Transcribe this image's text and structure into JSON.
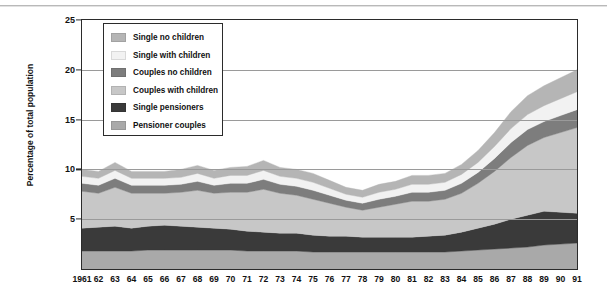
{
  "chart_data": {
    "type": "area",
    "stacked": true,
    "title": "",
    "xlabel": "",
    "ylabel": "Percentage of total population",
    "ylim": [
      0,
      25
    ],
    "yticks": [
      5,
      10,
      15,
      20,
      25
    ],
    "grid": true,
    "legend_position": "top-left inside",
    "x": [
      1961,
      1962,
      1963,
      1964,
      1965,
      1966,
      1967,
      1968,
      1969,
      1970,
      1971,
      1972,
      1973,
      1974,
      1975,
      1976,
      1977,
      1978,
      1979,
      1980,
      1981,
      1982,
      1983,
      1984,
      1985,
      1986,
      1987,
      1988,
      1989,
      1990,
      1991
    ],
    "xticklabels": [
      "1961",
      "62",
      "63",
      "64",
      "65",
      "66",
      "67",
      "68",
      "69",
      "70",
      "71",
      "72",
      "73",
      "74",
      "75",
      "76",
      "77",
      "78",
      "79",
      "80",
      "81",
      "82",
      "83",
      "84",
      "85",
      "86",
      "87",
      "88",
      "89",
      "90",
      "91"
    ],
    "series": [
      {
        "name": "Pensioner couples",
        "color": "#a9a9a9",
        "values": [
          1.8,
          1.8,
          1.8,
          1.8,
          1.9,
          1.9,
          1.9,
          1.9,
          1.9,
          1.9,
          1.8,
          1.8,
          1.8,
          1.8,
          1.7,
          1.7,
          1.7,
          1.7,
          1.7,
          1.7,
          1.7,
          1.7,
          1.7,
          1.8,
          1.9,
          2.0,
          2.1,
          2.2,
          2.4,
          2.5,
          2.6
        ]
      },
      {
        "name": "Single pensioners",
        "color": "#3a3a3a",
        "values": [
          2.3,
          2.4,
          2.5,
          2.3,
          2.4,
          2.5,
          2.4,
          2.3,
          2.2,
          2.1,
          2.0,
          1.9,
          1.8,
          1.8,
          1.7,
          1.6,
          1.6,
          1.5,
          1.5,
          1.5,
          1.5,
          1.6,
          1.7,
          1.9,
          2.2,
          2.5,
          2.9,
          3.2,
          3.4,
          3.2,
          3.0
        ]
      },
      {
        "name": "Couples with children",
        "color": "#c7c7c7",
        "values": [
          3.7,
          3.4,
          3.9,
          3.5,
          3.3,
          3.2,
          3.4,
          3.7,
          3.5,
          3.7,
          3.9,
          4.3,
          4.0,
          3.8,
          3.6,
          3.3,
          2.9,
          2.7,
          3.0,
          3.3,
          3.6,
          3.5,
          3.6,
          3.9,
          4.5,
          5.3,
          6.2,
          7.0,
          7.4,
          8.0,
          8.6
        ]
      },
      {
        "name": "Couples no children",
        "color": "#7d7d7d",
        "values": [
          0.8,
          0.8,
          0.9,
          0.8,
          0.8,
          0.8,
          0.8,
          0.9,
          0.8,
          0.9,
          0.9,
          1.0,
          0.9,
          0.9,
          0.9,
          0.8,
          0.7,
          0.7,
          0.8,
          0.8,
          0.9,
          0.9,
          0.9,
          1.0,
          1.1,
          1.3,
          1.5,
          1.6,
          1.6,
          1.7,
          1.8
        ]
      },
      {
        "name": "Single with children",
        "color": "#f2f2f2",
        "values": [
          0.7,
          0.7,
          0.8,
          0.7,
          0.7,
          0.7,
          0.7,
          0.8,
          0.7,
          0.8,
          0.8,
          0.9,
          0.8,
          0.8,
          0.8,
          0.7,
          0.6,
          0.6,
          0.7,
          0.7,
          0.8,
          0.8,
          0.8,
          0.9,
          1.0,
          1.2,
          1.4,
          1.5,
          1.6,
          1.7,
          1.8
        ]
      },
      {
        "name": "Single no children",
        "color": "#b5b5b5",
        "values": [
          0.7,
          0.7,
          0.8,
          0.7,
          0.7,
          0.7,
          0.8,
          0.8,
          0.8,
          0.8,
          0.9,
          1.0,
          0.9,
          0.9,
          0.9,
          0.8,
          0.7,
          0.7,
          0.8,
          0.8,
          0.9,
          0.9,
          0.9,
          1.0,
          1.2,
          1.4,
          1.7,
          1.9,
          2.0,
          2.1,
          2.2
        ]
      }
    ],
    "legend_order": [
      "Single no children",
      "Single with children",
      "Couples no children",
      "Couples with children",
      "Single pensioners",
      "Pensioner couples"
    ],
    "colors": {
      "single_no_children": "#b5b5b5",
      "single_with_children": "#f2f2f2",
      "couples_no_children": "#7d7d7d",
      "couples_with_children": "#c7c7c7",
      "single_pensioners": "#3a3a3a",
      "pensioner_couples": "#a9a9a9",
      "axis": "#2b2b2b",
      "gridline": "#9a9a9a",
      "background": "#ffffff"
    }
  }
}
